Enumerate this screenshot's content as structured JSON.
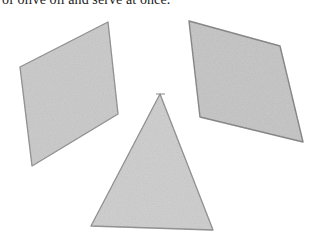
{
  "text": {
    "caption": "of olive oil and serve at once."
  },
  "figure": {
    "shapes": [
      {
        "name": "left-quadrilateral",
        "points": "20,67 108,22 118,114 32,166"
      },
      {
        "name": "right-quadrilateral",
        "points": "189,21 280,46 303,142 200,117"
      },
      {
        "name": "triangle",
        "points": "160,94 91,226 213,230"
      }
    ],
    "colors": {
      "fill": "#c9c9c9",
      "stroke": "#8a8a8a"
    }
  }
}
